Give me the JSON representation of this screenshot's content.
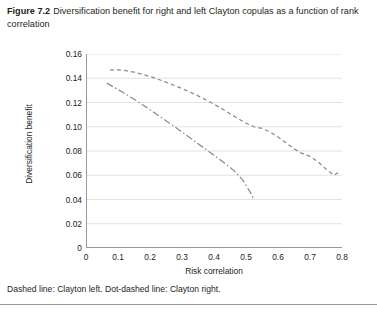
{
  "figure": {
    "number": "Figure 7.2",
    "caption": "Diversification benefit for right and left Clayton copulas as a function of rank correlation",
    "note": "Dashed line: Clayton left. Dot-dashed line: Clayton right."
  },
  "style": {
    "line_color": "#8c8c8c",
    "grid_color": "#e2e2e2",
    "axis_color": "#9a9a9a",
    "text_color": "#231f20",
    "background": "#ffffff"
  },
  "chart_data": {
    "type": "line",
    "title": "Diversification benefit for right and left Clayton copulas as a function of rank correlation",
    "xlabel": "Risk correlation",
    "ylabel": "Diversification benefit",
    "xlim": [
      0,
      0.8
    ],
    "ylim": [
      0,
      0.16
    ],
    "xticks": [
      0,
      0.1,
      0.2,
      0.3,
      0.4,
      0.5,
      0.6,
      0.7,
      0.8
    ],
    "xticklabels": [
      "0",
      "0.1",
      "0.2",
      "0.3",
      "0.4",
      "0.5",
      "0.6",
      "0.7",
      "0.8"
    ],
    "yticks": [
      0,
      0.02,
      0.04,
      0.06,
      0.08,
      0.1,
      0.12,
      0.14,
      0.16
    ],
    "yticklabels": [
      "0",
      "0.02",
      "0.04",
      "0.06",
      "0.08",
      "0.10",
      "0.12",
      "0.14",
      "0.16"
    ],
    "grid": "horizontal",
    "legend": "none",
    "annotation": "Dashed line: Clayton left. Dot-dashed line: Clayton right.",
    "series": [
      {
        "name": "Clayton left",
        "style": "dashed",
        "color": "#8c8c8c",
        "x": [
          0.075,
          0.1,
          0.125,
          0.15,
          0.175,
          0.2,
          0.225,
          0.25,
          0.275,
          0.3,
          0.325,
          0.35,
          0.375,
          0.4,
          0.425,
          0.45,
          0.475,
          0.5,
          0.525,
          0.55,
          0.575,
          0.6,
          0.625,
          0.65,
          0.675,
          0.7,
          0.725,
          0.75,
          0.775,
          0.79
        ],
        "y": [
          0.147,
          0.147,
          0.1462,
          0.145,
          0.1434,
          0.1414,
          0.1392,
          0.1368,
          0.1342,
          0.1315,
          0.1286,
          0.1255,
          0.1222,
          0.1186,
          0.1148,
          0.1108,
          0.1068,
          0.103,
          0.1,
          0.0986,
          0.0958,
          0.0916,
          0.0868,
          0.0818,
          0.078,
          0.0756,
          0.071,
          0.0652,
          0.06,
          0.0625
        ]
      },
      {
        "name": "Clayton right",
        "style": "dot-dashed",
        "color": "#8c8c8c",
        "x": [
          0.065,
          0.09,
          0.115,
          0.14,
          0.165,
          0.19,
          0.215,
          0.24,
          0.265,
          0.29,
          0.315,
          0.34,
          0.365,
          0.39,
          0.415,
          0.44,
          0.465,
          0.49,
          0.515,
          0.525
        ],
        "y": [
          0.136,
          0.1322,
          0.1284,
          0.1244,
          0.1202,
          0.1158,
          0.1113,
          0.1068,
          0.1022,
          0.0975,
          0.0928,
          0.088,
          0.0832,
          0.0784,
          0.0735,
          0.0686,
          0.0632,
          0.056,
          0.0452,
          0.04
        ]
      }
    ]
  }
}
